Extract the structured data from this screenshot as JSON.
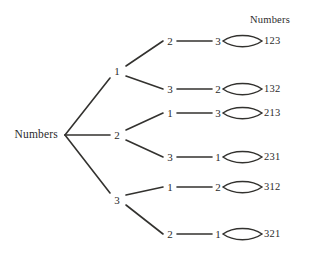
{
  "diagram": {
    "type": "tree-diagram",
    "title_label": "Numbers",
    "column_header": "Numbers",
    "root": {
      "label": "Numbers",
      "x": 35,
      "y": 135
    },
    "level1": [
      {
        "label": "1",
        "x": 117,
        "y": 71
      },
      {
        "label": "2",
        "x": 117,
        "y": 135
      },
      {
        "label": "3",
        "x": 117,
        "y": 200
      }
    ],
    "level2": [
      {
        "label": "2",
        "x": 170,
        "y": 41
      },
      {
        "label": "3",
        "x": 170,
        "y": 89
      },
      {
        "label": "1",
        "x": 170,
        "y": 113
      },
      {
        "label": "3",
        "x": 170,
        "y": 157
      },
      {
        "label": "1",
        "x": 170,
        "y": 187
      },
      {
        "label": "2",
        "x": 170,
        "y": 234
      }
    ],
    "level3": [
      {
        "label": "3",
        "x": 218,
        "y": 41
      },
      {
        "label": "2",
        "x": 218,
        "y": 89
      },
      {
        "label": "3",
        "x": 218,
        "y": 113
      },
      {
        "label": "1",
        "x": 218,
        "y": 157
      },
      {
        "label": "2",
        "x": 218,
        "y": 187
      },
      {
        "label": "1",
        "x": 218,
        "y": 234
      }
    ],
    "outcomes": [
      {
        "label": "123",
        "x": 265,
        "y": 41
      },
      {
        "label": "132",
        "x": 265,
        "y": 89
      },
      {
        "label": "213",
        "x": 265,
        "y": 113
      },
      {
        "label": "231",
        "x": 265,
        "y": 157
      },
      {
        "label": "312",
        "x": 265,
        "y": 187
      },
      {
        "label": "321",
        "x": 265,
        "y": 234
      }
    ],
    "header_pos": {
      "x": 270,
      "y": 20
    },
    "colors": {
      "background": "#ffffff",
      "stroke": "#33322f",
      "text": "#2b2b2b"
    }
  }
}
